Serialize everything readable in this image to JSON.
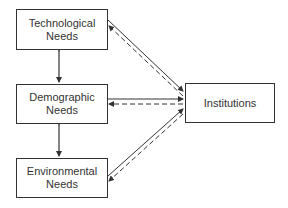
{
  "diagram": {
    "nodes": [
      {
        "id": "technological",
        "label_line1": "Technological",
        "label_line2": "Needs"
      },
      {
        "id": "demographic",
        "label_line1": "Demographic",
        "label_line2": "Needs"
      },
      {
        "id": "environmental",
        "label_line1": "Environmental",
        "label_line2": "Needs"
      },
      {
        "id": "institutions",
        "label_line1": "Institutions"
      }
    ],
    "edges": [
      {
        "from": "technological",
        "to": "demographic",
        "style": "solid",
        "direction": "bidirectional"
      },
      {
        "from": "demographic",
        "to": "environmental",
        "style": "solid",
        "direction": "bidirectional"
      },
      {
        "from": "technological",
        "to": "institutions",
        "style": "solid",
        "direction": "forward"
      },
      {
        "from": "institutions",
        "to": "technological",
        "style": "dashed",
        "direction": "forward"
      },
      {
        "from": "demographic",
        "to": "institutions",
        "style": "solid",
        "direction": "forward"
      },
      {
        "from": "institutions",
        "to": "demographic",
        "style": "dashed",
        "direction": "forward"
      },
      {
        "from": "environmental",
        "to": "institutions",
        "style": "solid",
        "direction": "forward"
      },
      {
        "from": "institutions",
        "to": "environmental",
        "style": "dashed",
        "direction": "forward"
      }
    ],
    "colors": {
      "stroke": "#333333",
      "background": "#ffffff"
    }
  }
}
